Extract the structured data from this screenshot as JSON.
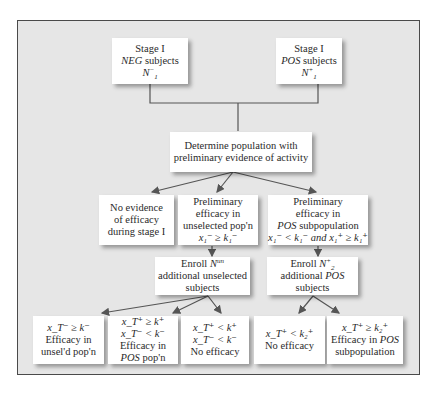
{
  "diagram": {
    "type": "flowchart",
    "colors": {
      "background": "#e6e6e6",
      "box": "#ffffff",
      "border": "#4a4a4a",
      "connector": "#555555",
      "text": "#2a2a2a"
    },
    "nodes": {
      "stage1_neg": {
        "line1": "Stage I",
        "line2_italic": "NEG",
        "line2_rest": " subjects",
        "line3": "N",
        "line3_sub": "1",
        "line3_sup": "−"
      },
      "stage1_pos": {
        "line1": "Stage I",
        "line2_italic": "POS",
        "line2_rest": " subjects",
        "line3": "N",
        "line3_sub": "1",
        "line3_sup": "+"
      },
      "determine": {
        "line1": "Determine population with",
        "line2": "preliminary evidence of activity"
      },
      "no_evidence": {
        "line1": "No evidence",
        "line2": "of efficacy",
        "line3": "during stage I"
      },
      "prelim_unselected": {
        "line1": "Preliminary",
        "line2": "efficacy in",
        "line3": "unselected pop'n",
        "cond": "x₁⁻ ≥ k₁⁻"
      },
      "prelim_pos": {
        "line1": "Preliminary",
        "line2": "efficacy in",
        "line3_italic": "POS",
        "line3_rest": " subpopulation",
        "cond": "x₁⁻ < k₁⁻ and x₁⁺ ≥ k₁⁺"
      },
      "enroll_unselected": {
        "line1_pre": "Enroll ",
        "line1_var": "N",
        "line1_sup": "un",
        "line2": "additional unselected",
        "line3": "subjects"
      },
      "enroll_pos": {
        "line1_pre": "Enroll ",
        "line1_var": "N",
        "line1_sub": "2",
        "line1_sup": "+",
        "line2_pre": "additional ",
        "line2_italic": "POS",
        "line3": "subjects"
      },
      "out_unsel": {
        "cond1": "x_T⁻ ≥ k⁻",
        "line1": "Efficacy in",
        "line2": "unsel'd pop'n"
      },
      "out_pos_pop": {
        "cond1": "x_T⁺ ≥ k⁺",
        "cond2": "x_T⁻ < k⁻",
        "line1": "Efficacy in",
        "line2_italic": "POS",
        "line2_rest": " pop'n"
      },
      "out_none1": {
        "cond1": "x_T⁺ < k⁺",
        "cond2": "x_T⁻ < k⁻",
        "line1": "No efficacy"
      },
      "out_none2": {
        "cond1": "x_T⁺ < k₂⁺",
        "line1": "No efficacy"
      },
      "out_pos_sub": {
        "cond1": "x_T⁺ ≥ k₂⁺",
        "line1_pre": "Efficacy in ",
        "line1_italic": "POS",
        "line2": "subpopulation"
      }
    }
  }
}
